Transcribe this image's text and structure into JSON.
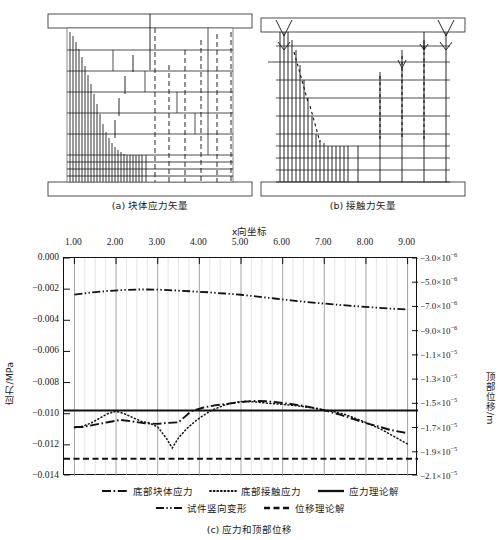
{
  "figure": {
    "subfigures": [
      {
        "id": "a",
        "caption": "(a) 块体应力矢量"
      },
      {
        "id": "b",
        "caption": "(b) 接触力矢量"
      }
    ],
    "bottom_caption": "(c) 应力和顶部位移"
  },
  "chart_data": {
    "type": "line",
    "title": "",
    "xlabel": "x向坐标",
    "ylabel": "应力/MPa",
    "y2label": "顶部位移/m",
    "xlim": [
      0.75,
      9.25
    ],
    "ylim": [
      -0.014,
      0.0
    ],
    "y2lim": [
      -2.1e-05,
      -3e-06
    ],
    "grid": true,
    "legend_position": "below",
    "xticks": [
      "1.00",
      "2.00",
      "3.00",
      "4.00",
      "5.00",
      "6.00",
      "7.00",
      "8.00",
      "9.00"
    ],
    "xtick_values": [
      1,
      2,
      3,
      4,
      5,
      6,
      7,
      8,
      9
    ],
    "yticks_left": [
      "0.000",
      "-0.002",
      "-0.004",
      "-0.006",
      "-0.008",
      "-0.010",
      "-0.012",
      "-0.014"
    ],
    "ytick_left_values": [
      0.0,
      -0.002,
      -0.004,
      -0.006,
      -0.008,
      -0.01,
      -0.012,
      -0.014
    ],
    "yticks_right": [
      "-3.0×10-6",
      "-5.0×10-6",
      "-7.0×10-6",
      "-9.0×10-6",
      "-1.1×10-5",
      "-1.3×10-5",
      "-1.5×10-5",
      "-1.7×10-5",
      "-1.9×10-5",
      "-2.1×10-5"
    ],
    "ytick_right_mantissa": [
      "-3.0",
      "-5.0",
      "-7.0",
      "-9.0",
      "-1.1",
      "-1.3",
      "-1.5",
      "-1.7",
      "-1.9",
      "-2.1"
    ],
    "ytick_right_exponent": [
      "-6",
      "-6",
      "-6",
      "-6",
      "-5",
      "-5",
      "-5",
      "-5",
      "-5",
      "-5"
    ],
    "ytick_right_values": [
      -3e-06,
      -5e-06,
      -7e-06,
      -9e-06,
      -1.1e-05,
      -1.3e-05,
      -1.5e-05,
      -1.7e-05,
      -1.9e-05,
      -2.1e-05
    ],
    "series": [
      {
        "name": "底部块体应力",
        "style": "dashdot",
        "axis": "left",
        "x": [
          1.0,
          1.2,
          1.5,
          1.8,
          2.1,
          2.4,
          2.7,
          3.0,
          3.2,
          3.5,
          3.8,
          4.1,
          4.4,
          4.7,
          5.0,
          5.3,
          5.6,
          5.9,
          6.2,
          6.5,
          6.8,
          7.1,
          7.4,
          7.7,
          8.0,
          8.3,
          8.6,
          9.0
        ],
        "values": [
          -0.01085,
          -0.01085,
          -0.0107,
          -0.01055,
          -0.0104,
          -0.0105,
          -0.01062,
          -0.01065,
          -0.0106,
          -0.01055,
          -0.00985,
          -0.0096,
          -0.00945,
          -0.00935,
          -0.00925,
          -0.00918,
          -0.0092,
          -0.00928,
          -0.00938,
          -0.0095,
          -0.00965,
          -0.00985,
          -0.01008,
          -0.01035,
          -0.0106,
          -0.01082,
          -0.01105,
          -0.01125
        ]
      },
      {
        "name": "底部接触应力",
        "style": "dotted",
        "axis": "left",
        "x": [
          1.0,
          1.2,
          1.4,
          1.6,
          1.8,
          2.0,
          2.2,
          2.4,
          2.6,
          2.8,
          3.0,
          3.2,
          3.35,
          3.5,
          3.7,
          3.9,
          4.1,
          4.3,
          4.6,
          4.9,
          5.1,
          5.4,
          5.7,
          6.0,
          6.3,
          6.6,
          6.9,
          7.2,
          7.5,
          7.8,
          8.1,
          8.4,
          8.7,
          9.0
        ],
        "values": [
          -0.0109,
          -0.0108,
          -0.0106,
          -0.0103,
          -0.01,
          -0.00985,
          -0.01,
          -0.01025,
          -0.01048,
          -0.0106,
          -0.01085,
          -0.01155,
          -0.0122,
          -0.01155,
          -0.01095,
          -0.01048,
          -0.0101,
          -0.00978,
          -0.00945,
          -0.00925,
          -0.0092,
          -0.00926,
          -0.00934,
          -0.0094,
          -0.00948,
          -0.00958,
          -0.0097,
          -0.00985,
          -0.01005,
          -0.01035,
          -0.01068,
          -0.01105,
          -0.0115,
          -0.01195
        ]
      },
      {
        "name": "应力理论解",
        "style": "solid",
        "axis": "left",
        "x": [
          0.75,
          9.25
        ],
        "values": [
          -0.0098,
          -0.0098
        ]
      },
      {
        "name": "试件竖向变形",
        "style": "dashdotdot",
        "axis": "left",
        "x": [
          1.0,
          1.4,
          1.8,
          2.2,
          2.6,
          3.0,
          3.4,
          3.8,
          4.2,
          4.6,
          5.0,
          5.4,
          5.8,
          6.2,
          6.6,
          7.0,
          7.4,
          7.8,
          8.2,
          8.6,
          9.0
        ],
        "values": [
          -0.00235,
          -0.00222,
          -0.00212,
          -0.00205,
          -0.00202,
          -0.00203,
          -0.00208,
          -0.00214,
          -0.0022,
          -0.00228,
          -0.00236,
          -0.00248,
          -0.0026,
          -0.00272,
          -0.00283,
          -0.00293,
          -0.00302,
          -0.0031,
          -0.00318,
          -0.00325,
          -0.0033
        ]
      },
      {
        "name": "位移理论解",
        "style": "dashed",
        "axis": "left",
        "x": [
          0.75,
          9.25
        ],
        "values": [
          -0.0129,
          -0.0129
        ]
      }
    ]
  },
  "legend": {
    "items": [
      {
        "label": "底部块体应力",
        "style": "dashdot"
      },
      {
        "label": "底部接触应力",
        "style": "dotted"
      },
      {
        "label": "应力理论解",
        "style": "solid"
      },
      {
        "label": "试件竖向变形",
        "style": "dashdotdot"
      },
      {
        "label": "位移理论解",
        "style": "dashed"
      }
    ]
  }
}
